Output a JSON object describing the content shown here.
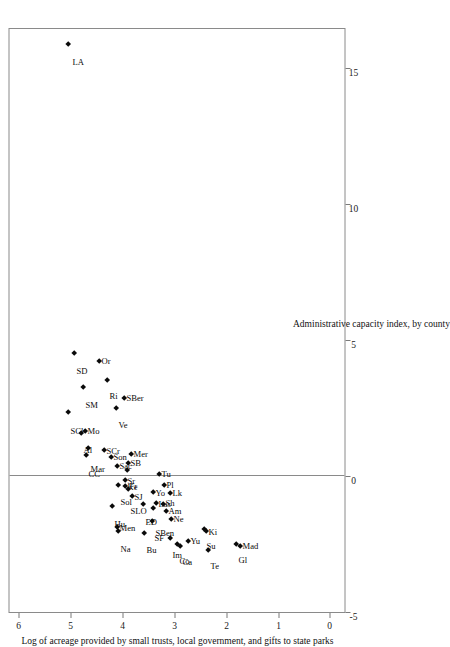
{
  "chart_data": {
    "type": "scatter",
    "title": "",
    "xlabel": "Administrative capacity index, by county",
    "ylabel": "Log of acreage provided by small trusts, local government, and gifts to state parks",
    "xlim": [
      -5,
      16.5
    ],
    "ylim": [
      -0.3,
      6.2
    ],
    "xticks": [
      -5,
      0,
      5,
      10,
      15
    ],
    "xticklabels": [
      "-5",
      "0",
      "5",
      "10",
      "15"
    ],
    "yticks": [
      0,
      1,
      2,
      3,
      4,
      5,
      6
    ],
    "yticklabels": [
      "0",
      "1",
      "2",
      "3",
      "4",
      "5",
      "6"
    ],
    "grid": false,
    "legend": null,
    "reference_line_x": 0,
    "marker": "filled-diamond",
    "points": [
      {
        "label": "LA",
        "x": 15.9,
        "y": 5.05,
        "lx": -14,
        "ly": 4
      },
      {
        "label": "SD",
        "x": 4.55,
        "y": 4.92,
        "lx": -14,
        "ly": 2
      },
      {
        "label": "Or",
        "x": 4.25,
        "y": 4.45,
        "lx": 4,
        "ly": 2
      },
      {
        "label": "SM",
        "x": 3.3,
        "y": 4.75,
        "lx": -14,
        "ly": 2
      },
      {
        "label": "Ri",
        "x": 3.55,
        "y": 4.3,
        "lx": -12,
        "ly": 2
      },
      {
        "label": "SBer",
        "x": 2.9,
        "y": 3.97,
        "lx": 4,
        "ly": 2
      },
      {
        "label": "Ve",
        "x": 2.55,
        "y": 4.12,
        "lx": -13,
        "ly": 2
      },
      {
        "label": "SCl",
        "x": 2.4,
        "y": 5.05,
        "lx": -15,
        "ly": 2
      },
      {
        "label": "Mo",
        "x": 1.7,
        "y": 4.72,
        "lx": 4,
        "ly": 2
      },
      {
        "label": "Al",
        "x": 1.62,
        "y": 4.8,
        "lx": -13,
        "ly": 2
      },
      {
        "label": "Mar",
        "x": 1.05,
        "y": 4.66,
        "lx": -17,
        "ly": 2
      },
      {
        "label": "SCr",
        "x": 1.0,
        "y": 4.35,
        "lx": 3,
        "ly": 2
      },
      {
        "label": "CC",
        "x": 0.8,
        "y": 4.7,
        "lx": -15,
        "ly": 2
      },
      {
        "label": "Son",
        "x": 0.72,
        "y": 4.22,
        "lx": 4,
        "ly": 2
      },
      {
        "label": "Mer",
        "x": 0.85,
        "y": 3.82,
        "lx": 4,
        "ly": 2
      },
      {
        "label": "SB",
        "x": 0.52,
        "y": 3.88,
        "lx": 4,
        "ly": 2
      },
      {
        "label": "Sac",
        "x": 0.42,
        "y": 4.1,
        "lx": 4,
        "ly": 2
      },
      {
        "label": "Fr",
        "x": 0.25,
        "y": 3.9,
        "lx": -12,
        "ly": 2
      },
      {
        "label": "Sol",
        "x": -0.28,
        "y": 4.08,
        "lx": -13,
        "ly": 2
      },
      {
        "label": "Sr",
        "x": -0.1,
        "y": 3.95,
        "lx": 3,
        "ly": 2
      },
      {
        "label": "Ke",
        "x": -0.35,
        "y": 3.95,
        "lx": 3,
        "ly": 2
      },
      {
        "label": "SLO",
        "x": -0.45,
        "y": 3.88,
        "lx": -18,
        "ly": 2
      },
      {
        "label": "SJ",
        "x": -0.7,
        "y": 3.8,
        "lx": 3,
        "ly": 2
      },
      {
        "label": "Hu",
        "x": -1.05,
        "y": 4.2,
        "lx": -14,
        "ly": 2
      },
      {
        "label": "ED",
        "x": -1.0,
        "y": 3.6,
        "lx": -14,
        "ly": 2
      },
      {
        "label": "Tu",
        "x": 0.1,
        "y": 3.28,
        "lx": 4,
        "ly": 2
      },
      {
        "label": "Pl",
        "x": -0.3,
        "y": 3.2,
        "lx": 4,
        "ly": 2
      },
      {
        "label": "Yo",
        "x": -0.55,
        "y": 3.4,
        "lx": 3,
        "ly": 2
      },
      {
        "label": "Lk",
        "x": -0.6,
        "y": 3.08,
        "lx": 4,
        "ly": 2
      },
      {
        "label": "Las",
        "x": -0.95,
        "y": 3.35,
        "lx": 3,
        "ly": 2
      },
      {
        "label": "Sh",
        "x": -1.0,
        "y": 3.22,
        "lx": 5,
        "ly": 2
      },
      {
        "label": "SBen",
        "x": -1.15,
        "y": 3.4,
        "lx": -21,
        "ly": 2
      },
      {
        "label": "Am",
        "x": -1.25,
        "y": 3.15,
        "lx": 4,
        "ly": 2
      },
      {
        "label": "Ne",
        "x": -1.55,
        "y": 3.05,
        "lx": 4,
        "ly": 2
      },
      {
        "label": "SF",
        "x": -1.62,
        "y": 3.42,
        "lx": -13,
        "ly": 2
      },
      {
        "label": "Men",
        "x": -1.85,
        "y": 4.1,
        "lx": 3,
        "ly": 2
      },
      {
        "label": "Na",
        "x": -2.0,
        "y": 4.08,
        "lx": -14,
        "ly": 2
      },
      {
        "label": "Bu",
        "x": -2.05,
        "y": 3.58,
        "lx": -13,
        "ly": 2
      },
      {
        "label": "Im",
        "x": -2.25,
        "y": 3.08,
        "lx": -13,
        "ly": 2
      },
      {
        "label": "Co",
        "x": -2.45,
        "y": 2.95,
        "lx": -13,
        "ly": 2
      },
      {
        "label": "Ca",
        "x": -2.52,
        "y": 2.88,
        "lx": -12,
        "ly": 2
      },
      {
        "label": "Yu",
        "x": -2.35,
        "y": 2.72,
        "lx": 4,
        "ly": 2
      },
      {
        "label": "Te",
        "x": -2.7,
        "y": 2.35,
        "lx": -12,
        "ly": 2
      },
      {
        "label": "Su",
        "x": -1.9,
        "y": 2.42,
        "lx": -13,
        "ly": 2
      },
      {
        "label": "Ki",
        "x": -2.0,
        "y": 2.38,
        "lx": 3,
        "ly": 2
      },
      {
        "label": "Gl",
        "x": -2.48,
        "y": 1.8,
        "lx": -12,
        "ly": 2
      },
      {
        "label": "Mad",
        "x": -2.55,
        "y": 1.72,
        "lx": 4,
        "ly": 2
      }
    ]
  }
}
